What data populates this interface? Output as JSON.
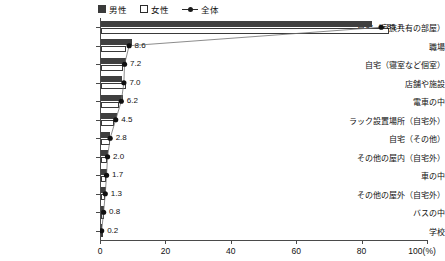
{
  "legend": {
    "entries": [
      {
        "key": "male",
        "label": "男性",
        "marker": "filled-square",
        "color": "#3f3f3f"
      },
      {
        "key": "female",
        "label": "女性",
        "marker": "open-square",
        "color": "#ffffff"
      },
      {
        "key": "total",
        "label": "全体",
        "marker": "line-with-dot",
        "color": "#1a1a1a"
      }
    ]
  },
  "chart_data": {
    "type": "bar",
    "orientation": "horizontal",
    "title": "",
    "xlabel": "",
    "ylabel": "",
    "xlim": [
      0,
      100
    ],
    "xticks": [
      0,
      20,
      40,
      60,
      80,
      100
    ],
    "xtick_labels": [
      "0",
      "20",
      "40",
      "60",
      "80",
      "100(%)"
    ],
    "unit": "(%)",
    "grid": false,
    "legend_position": "top-center",
    "categories": [
      "自宅（家族共有の部屋）",
      "職場",
      "自宅（寝室など個室）",
      "店舗や施設",
      "電車の中",
      "ラック設置場所（自宅外）",
      "自宅（その他）",
      "その他の屋内（自宅外）",
      "車の中",
      "その他の屋外（自宅外）",
      "バスの中",
      "学校"
    ],
    "series": [
      {
        "name": "男性",
        "values": [
          83.0,
          9.4,
          7.7,
          6.5,
          6.7,
          4.8,
          2.9,
          2.2,
          1.9,
          1.5,
          0.8,
          0.2
        ]
      },
      {
        "name": "女性",
        "values": [
          88.0,
          7.6,
          6.6,
          7.5,
          5.6,
          4.1,
          2.7,
          1.8,
          1.4,
          1.1,
          0.8,
          0.2
        ]
      },
      {
        "name": "全体",
        "values": [
          85.7,
          8.6,
          7.2,
          7.0,
          6.2,
          4.5,
          2.8,
          2.0,
          1.7,
          1.3,
          0.8,
          0.2
        ]
      }
    ],
    "data_labels": [
      "85.7",
      "8.6",
      "7.2",
      "7.0",
      "6.2",
      "4.5",
      "2.8",
      "2.0",
      "1.7",
      "1.3",
      "0.8",
      "0.2"
    ]
  }
}
